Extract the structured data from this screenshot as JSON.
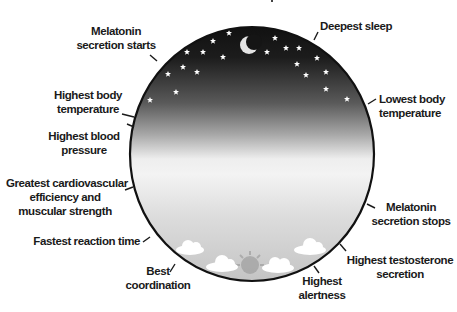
{
  "diagram": {
    "type": "circadian-clock",
    "colors": {
      "night": "#151515",
      "mid": "#9a9a9a",
      "day": "#efefef",
      "bottom": "#c8c8c8",
      "outline": "#111111",
      "stars": "#ffffff",
      "moon": "#e6e6e6",
      "clouds": "#ffffff",
      "sun": "#9e9e9e"
    },
    "labels": [
      {
        "id": "deepest-sleep",
        "line1": "Deepest sleep",
        "line2": ""
      },
      {
        "id": "lowest-body-temperature",
        "line1": "Lowest body",
        "line2": "temperature"
      },
      {
        "id": "melatonin-secretion-stops",
        "line1": "Melatonin",
        "line2": "secretion stops"
      },
      {
        "id": "highest-testosterone-secretion",
        "line1": "Highest testosterone",
        "line2": "secretion"
      },
      {
        "id": "highest-alertness",
        "line1": "Highest",
        "line2": "alertness"
      },
      {
        "id": "best-coordination",
        "line1": "Best",
        "line2": "coordination"
      },
      {
        "id": "fastest-reaction-time",
        "line1": "Fastest reaction time",
        "line2": ""
      },
      {
        "id": "greatest-cardiovascular-efficiency",
        "line1": "Greatest cardiovascular",
        "line2": "efficiency and",
        "line3": "muscular strength"
      },
      {
        "id": "highest-blood-pressure",
        "line1": "Highest blood",
        "line2": "pressure"
      },
      {
        "id": "highest-body-temperature",
        "line1": "Highest body",
        "line2": "temperature"
      },
      {
        "id": "melatonin-secretion-starts",
        "line1": "Melatonin",
        "line2": "secretion starts"
      }
    ]
  }
}
